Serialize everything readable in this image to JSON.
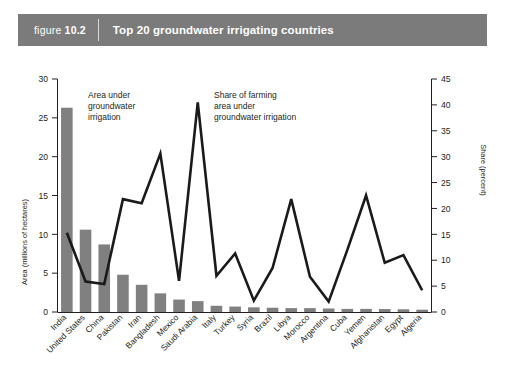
{
  "header": {
    "figure_word": "figure",
    "figure_number": "10.2",
    "title": "Top 20 groundwater irrigating countries"
  },
  "annotations": {
    "bars": "Area under groundwater irrigation",
    "bars_line1": "Area under",
    "bars_line2": "groundwater",
    "bars_line3": "irrigation",
    "line": "Share of farming area under groundwater irrigation",
    "line_line1": "Share of farming",
    "line_line2": "area under",
    "line_line3": "groundwater irrigation"
  },
  "colors": {
    "header_band": "#7b7b7b",
    "bar_fill": "#808080",
    "line_stroke": "#1a1a1a",
    "axis": "#231f20",
    "background": "#ffffff"
  },
  "chart_data": {
    "type": "bar",
    "title": "Top 20 groundwater irrigating countries",
    "xlabel": "",
    "ylabel": "Area (millions of hectares)",
    "y2label": "Share (percent)",
    "ylim": [
      0,
      30
    ],
    "y2lim": [
      0,
      45
    ],
    "yticks": [
      0,
      5,
      10,
      15,
      20,
      25,
      30
    ],
    "y2ticks": [
      0,
      5,
      10,
      15,
      20,
      25,
      30,
      35,
      40,
      45
    ],
    "grid": false,
    "legend_position": "annotations-inline",
    "categories": [
      "India",
      "United States",
      "China",
      "Pakistan",
      "Iran",
      "Bangladesh",
      "Mexico",
      "Saudi Arabia",
      "Italy",
      "Turkey",
      "Syria",
      "Brazil",
      "Libya",
      "Morocco",
      "Argentina",
      "Cuba",
      "Yemen",
      "Afghanistan",
      "Egypt",
      "Algeria"
    ],
    "series": [
      {
        "name": "Area under groundwater irrigation",
        "type": "bar",
        "axis": "left",
        "unit": "millions of hectares",
        "values": [
          26.3,
          10.6,
          8.7,
          4.8,
          3.5,
          2.4,
          1.6,
          1.4,
          0.8,
          0.7,
          0.6,
          0.55,
          0.5,
          0.5,
          0.45,
          0.4,
          0.4,
          0.38,
          0.35,
          0.3
        ]
      },
      {
        "name": "Share of farming area under groundwater irrigation",
        "type": "line",
        "axis": "right",
        "unit": "percent",
        "values": [
          15.3,
          5.9,
          5.4,
          21.8,
          21.0,
          30.6,
          6.0,
          40.5,
          7.0,
          11.3,
          2.2,
          8.5,
          21.8,
          6.8,
          2.0,
          12.0,
          22.5,
          9.5,
          11.0,
          4.2
        ]
      }
    ]
  }
}
